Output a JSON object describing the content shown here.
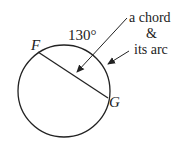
{
  "diagram": {
    "angle_label": "130°",
    "point_f": "F",
    "point_g": "G",
    "annotation_line1": "a chord",
    "annotation_line2": "&",
    "annotation_line3": "its arc",
    "stroke_color": "#222222"
  }
}
